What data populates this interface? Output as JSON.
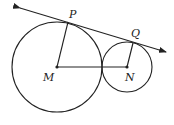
{
  "diagram": {
    "stroke_color": "#222222",
    "background": "#ffffff",
    "circles": [
      {
        "name": "circle-M",
        "center_label": "M",
        "cx": 57,
        "cy": 67,
        "r": 45
      },
      {
        "name": "circle-N",
        "center_label": "N",
        "cx": 127,
        "cy": 67,
        "r": 25
      }
    ],
    "points": {
      "P": {
        "label": "P",
        "x": 68,
        "y": 22
      },
      "Q": {
        "label": "Q",
        "x": 133,
        "y": 43
      },
      "M": {
        "label": "M",
        "x": 57,
        "y": 67
      },
      "N": {
        "label": "N",
        "x": 127,
        "y": 67
      }
    },
    "segments": [
      {
        "from": "M",
        "to": "P"
      },
      {
        "from": "N",
        "to": "Q"
      },
      {
        "from": "M",
        "to": "N"
      }
    ],
    "tangent_line": {
      "x1": 20,
      "y1": 8,
      "x2": 166,
      "y2": 52,
      "arrows": "both"
    },
    "labels": {
      "P": "P",
      "Q": "Q",
      "M": "M",
      "N": "N"
    }
  }
}
